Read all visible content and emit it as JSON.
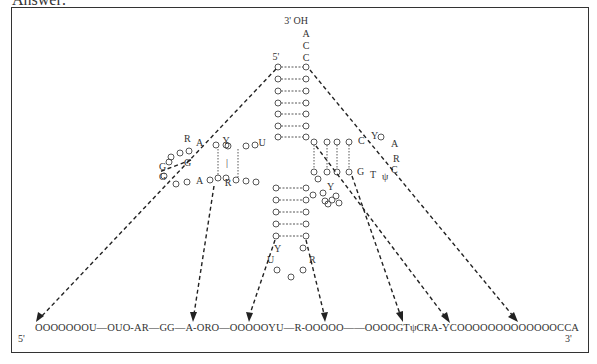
{
  "header": {
    "label": "Answer:"
  },
  "diagram": {
    "labels": {
      "three_prime_oh": "3' OH",
      "acceptor_tail": [
        "A",
        "C",
        "C"
      ],
      "five_prime_top": "5'",
      "d_loop": [
        "R",
        "A",
        "Y",
        "G",
        "G",
        "A",
        "R",
        "U"
      ],
      "tpsi_loop": [
        "C",
        "Y",
        "A",
        "R",
        "C",
        "G",
        "T",
        "ψ",
        "Y"
      ],
      "anticodon_loop": [
        "Y",
        "U",
        "R"
      ],
      "pair_bar": "|"
    },
    "linear_sequence": {
      "five_prime": "5'",
      "three_prime": "3'",
      "text": "OOOOOOOU—OUO-AR—GG—A-ORO—OOOOOYU—R-OOOOO——OOOOGTψCRA-YCOOOOOOOOOOOOOCCA"
    },
    "colors": {
      "line": "#333333",
      "background": "#ffffff"
    }
  }
}
